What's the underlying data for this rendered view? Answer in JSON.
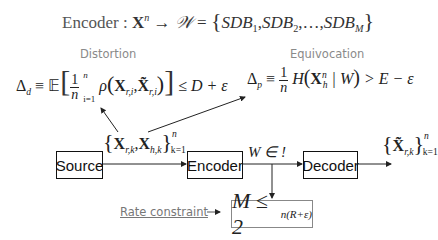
{
  "title": {
    "prefix": "Encoder :",
    "mapping": "X",
    "mapping_sup": "n",
    "arrow": "→",
    "target": "𝒲",
    "equals": "=",
    "set_items": [
      "SDB",
      "SDB",
      "…",
      "SDB"
    ],
    "set_subs": [
      "1",
      "2",
      "",
      "M"
    ]
  },
  "distortion": {
    "label": "Distortion",
    "lhs": "Δ",
    "lhs_sub": "d",
    "equiv": "≡",
    "expect": "𝔼",
    "frac_num": "1",
    "frac_den": "n",
    "sum_top": "n",
    "sum_bottom": "i=1",
    "rho": "ρ",
    "x1": "X",
    "x1_sub": "r,i",
    "x2": "X̃",
    "x2_sub": "r,i",
    "rhs": "≤ D + ε"
  },
  "equivocation": {
    "label": "Equivocation",
    "lhs": "Δ",
    "lhs_sub": "p",
    "equiv": "≡",
    "frac_num": "1",
    "frac_den": "n",
    "H": "H",
    "x": "X",
    "x_sup": "n",
    "x_sub": "h",
    "given": "| W",
    "rhs": "> E − ε"
  },
  "source_signal": {
    "x1": "X",
    "x1_sub": "r,k",
    "x2": "X",
    "x2_sub": "h,k",
    "sup": "n",
    "sub": "k=1"
  },
  "blocks": {
    "source": "Source",
    "encoder": "Encoder",
    "decoder": "Decoder"
  },
  "encoder_output": "W ∈ !",
  "decoder_output": {
    "x": "X̃",
    "x_sub": "r,k",
    "sup": "n",
    "sub": "k=1"
  },
  "rate": {
    "label": "Rate constraint",
    "arrow": "→",
    "lhs": "M ≤ 2",
    "exp": "n(R+ε)"
  }
}
